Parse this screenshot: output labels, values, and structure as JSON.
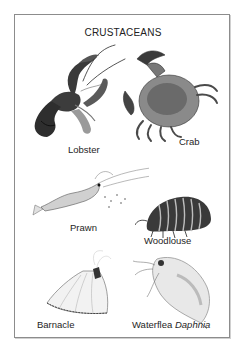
{
  "plate": {
    "title": "CRUSTACEANS",
    "border_color": "#8c8c8c",
    "specimens": [
      {
        "name": "Lobster",
        "icon": "lobster-illustration"
      },
      {
        "name": "Crab",
        "icon": "crab-illustration"
      },
      {
        "name": "Prawn",
        "icon": "prawn-illustration"
      },
      {
        "name": "Woodlouse",
        "icon": "woodlouse-illustration"
      },
      {
        "name": "Barnacle",
        "icon": "barnacle-illustration"
      },
      {
        "name": "Waterflea",
        "italic_name": "Daphnia",
        "icon": "waterflea-illustration"
      }
    ]
  }
}
